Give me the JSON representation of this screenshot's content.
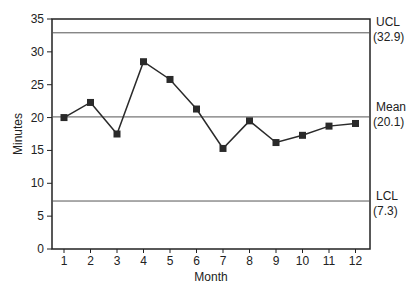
{
  "chart_data": {
    "type": "line",
    "title": "",
    "xlabel": "Month",
    "ylabel": "Minutes",
    "categories": [
      1,
      2,
      3,
      4,
      5,
      6,
      7,
      8,
      9,
      10,
      11,
      12
    ],
    "series": [
      {
        "name": "Minutes",
        "values": [
          20.0,
          22.3,
          17.5,
          28.5,
          25.8,
          21.3,
          15.3,
          19.5,
          16.2,
          17.3,
          18.7,
          19.1
        ]
      }
    ],
    "ylim": [
      0,
      35
    ],
    "yticks": [
      0,
      5,
      10,
      15,
      20,
      25,
      30,
      35
    ],
    "grid": false,
    "reference_lines": [
      {
        "name": "UCL",
        "value": 32.9,
        "label": "UCL",
        "value_label": "(32.9)"
      },
      {
        "name": "Mean",
        "value": 20.1,
        "label": "Mean",
        "value_label": "(20.1)"
      },
      {
        "name": "LCL",
        "value": 7.3,
        "label": "LCL",
        "value_label": "(7.3)"
      }
    ]
  },
  "colors": {
    "line": "#2a2a2a",
    "marker": "#2a2a2a",
    "axis": "#222222",
    "reference": "#555555"
  }
}
